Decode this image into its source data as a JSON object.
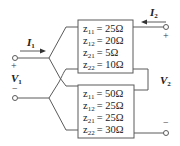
{
  "diagram": {
    "top_network": {
      "params": [
        {
          "name": "z",
          "sub": "11",
          "value": "= 25Ω"
        },
        {
          "name": "z",
          "sub": "12",
          "value": "= 20Ω"
        },
        {
          "name": "z",
          "sub": "21",
          "value": "= 5Ω"
        },
        {
          "name": "z",
          "sub": "22",
          "value": "= 10Ω"
        }
      ]
    },
    "bottom_network": {
      "params": [
        {
          "name": "z",
          "sub": "11",
          "value": "= 50Ω"
        },
        {
          "name": "z",
          "sub": "12",
          "value": "= 25Ω"
        },
        {
          "name": "z",
          "sub": "21",
          "value": "= 25Ω"
        },
        {
          "name": "z",
          "sub": "22",
          "value": "= 30Ω"
        }
      ]
    },
    "labels": {
      "I1": {
        "main": "I",
        "sub": "1"
      },
      "I2": {
        "main": "I",
        "sub": "2"
      },
      "V1": {
        "main": "V",
        "sub": "1"
      },
      "V2": {
        "main": "V",
        "sub": "2"
      },
      "plus": "+",
      "minus": "−"
    },
    "colors": {
      "wire": "#5a5a5a",
      "text": "#222222"
    }
  }
}
